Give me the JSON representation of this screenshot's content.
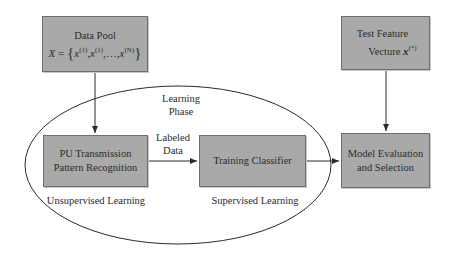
{
  "diagram": {
    "nodes": {
      "data_pool": {
        "title": "Data Pool",
        "formula_var": "X",
        "formula_eq": " = ",
        "formula_open": "{",
        "formula_x": "x",
        "formula_sup1": "(1)",
        "formula_sup2": "(1)",
        "formula_dots": ",…,",
        "formula_supN": "(N)",
        "formula_close": "}"
      },
      "test_feature": {
        "line1": "Test Feature",
        "line2": "Vecture ",
        "var": "x",
        "sup": "(*)"
      },
      "pu_recognition": {
        "line1": "PU Transmission",
        "line2": "Pattern Recognition"
      },
      "training_classifier": {
        "label": "Training Classifier"
      },
      "model_evaluation": {
        "line1": "Model Evaluation",
        "line2": "and Selection"
      }
    },
    "labels": {
      "learning_phase_1": "Learning",
      "learning_phase_2": "Phase",
      "labeled_data_1": "Labeled",
      "labeled_data_2": "Data",
      "unsupervised": "Unsupervised Learning",
      "supervised": "Supervised Learning"
    },
    "edges": [
      {
        "from": "data_pool",
        "to": "pu_recognition"
      },
      {
        "from": "pu_recognition",
        "to": "training_classifier",
        "label": "Labeled Data"
      },
      {
        "from": "training_classifier",
        "to": "model_evaluation"
      },
      {
        "from": "test_feature",
        "to": "model_evaluation"
      }
    ],
    "colors": {
      "box_fill": "#a9a9a9",
      "box_border": "#6e6e6e",
      "line": "#2b2b2b"
    }
  }
}
